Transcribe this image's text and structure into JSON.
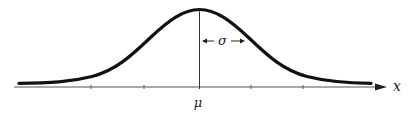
{
  "diagram": {
    "type": "normal-distribution-curve",
    "labels": {
      "mean": "μ",
      "std_dev": "σ",
      "x_axis": "x"
    },
    "axis": {
      "tick_count": 5,
      "has_arrow": true
    },
    "colors": {
      "curve": "#111111",
      "axis": "#555555",
      "text": "#1a1a1a"
    }
  }
}
